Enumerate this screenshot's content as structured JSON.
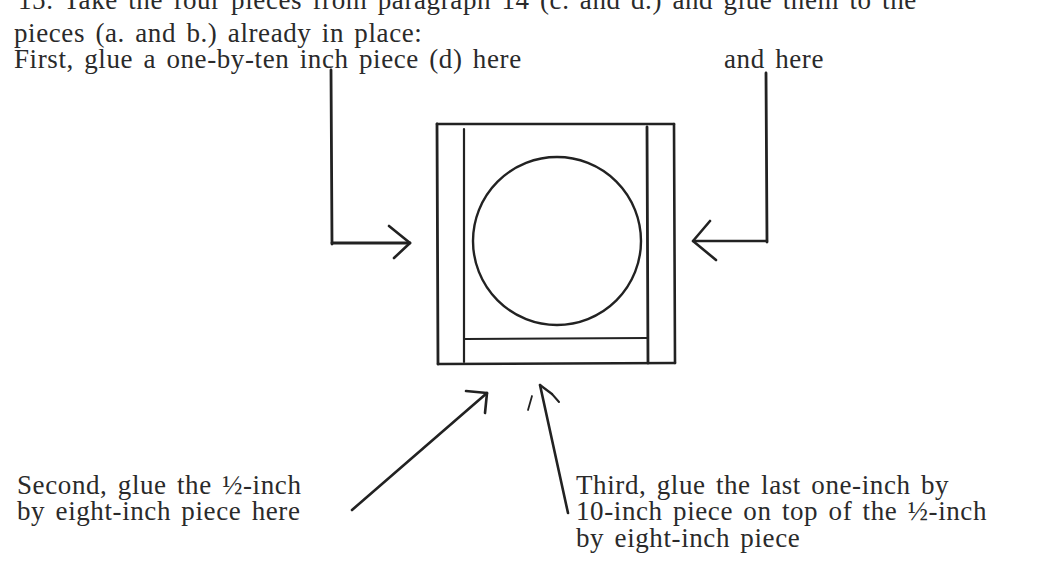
{
  "document": {
    "lines_top": [
      "15.  Take the four pieces from paragraph 14 (c. and d.) and glue them to the",
      "pieces (a. and b.) already in place:",
      "First, glue a one-by-ten inch piece (d) here"
    ],
    "label_and_here": "and here",
    "label_second": [
      "Second, glue the ½-inch",
      "by eight-inch piece here"
    ],
    "label_third": [
      "Third, glue the last one-inch by",
      "10-inch piece on top of the ½-inch",
      "by eight-inch piece"
    ]
  },
  "diagram": {
    "colors": {
      "ink": "#222222",
      "text": "#2a2a2a",
      "background": "#ffffff"
    }
  }
}
